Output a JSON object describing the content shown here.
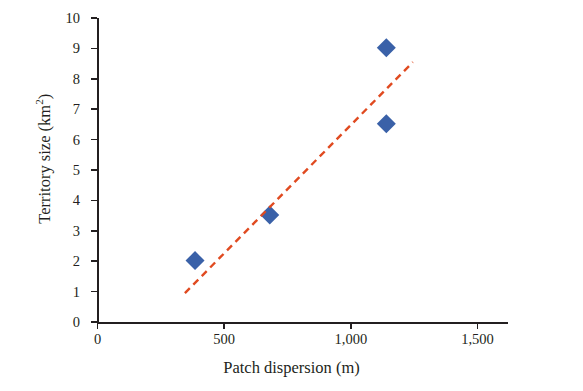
{
  "chart_data": {
    "type": "scatter",
    "title": "",
    "xlabel": "Patch dispersion (m)",
    "ylabel": "Territory size (km²)",
    "ylabel_main": "Territory size (km",
    "ylabel_sup": "2",
    "ylabel_tail": ")",
    "xlim": [
      0,
      1500
    ],
    "ylim": [
      0,
      10
    ],
    "grid": false,
    "legend": null,
    "x_ticks": [
      0,
      500,
      1000,
      1500
    ],
    "x_tick_labels": [
      "0",
      "500",
      "1,000",
      "1,500"
    ],
    "y_ticks": [
      0,
      1,
      2,
      3,
      4,
      5,
      6,
      7,
      8,
      9,
      10
    ],
    "y_tick_labels": [
      "0",
      "1",
      "2",
      "3",
      "4",
      "5",
      "6",
      "7",
      "8",
      "9",
      "10"
    ],
    "series": [
      {
        "name": "observations",
        "type": "scatter",
        "marker": "diamond",
        "color": "#3a61a8",
        "points": [
          {
            "x": 385,
            "y": 2.02
          },
          {
            "x": 680,
            "y": 3.52
          },
          {
            "x": 1140,
            "y": 6.52
          },
          {
            "x": 1140,
            "y": 9.02
          }
        ]
      },
      {
        "name": "trend line",
        "type": "line",
        "style": "dashed",
        "color": "#e04a20",
        "points": [
          {
            "x": 345,
            "y": 0.95
          },
          {
            "x": 1245,
            "y": 8.55
          }
        ]
      }
    ]
  }
}
